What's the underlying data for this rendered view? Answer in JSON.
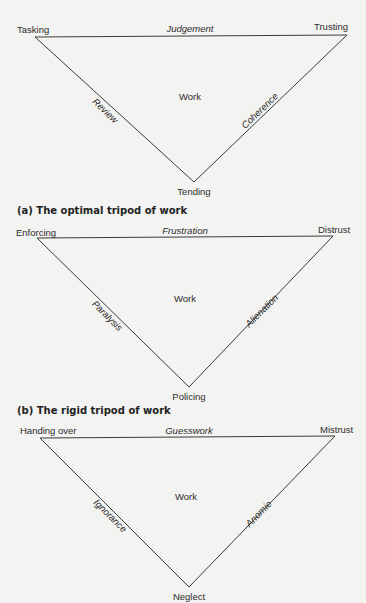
{
  "diagrams": [
    {
      "caption": "(a) The optimal tripod of work",
      "center": "Work",
      "vertices": {
        "top_left": "Tasking",
        "top_right": "Trusting",
        "bottom": "Tending"
      },
      "edges": {
        "top": "Judgement",
        "left": "Review",
        "right": "Coherence"
      }
    },
    {
      "caption": "(b) The rigid tripod of work",
      "center": "Work",
      "vertices": {
        "top_left": "Enforcing",
        "top_right": "Distrust",
        "bottom": "Policing"
      },
      "edges": {
        "top": "Frustration",
        "left": "Paralysis",
        "right": "Alienation"
      }
    },
    {
      "caption": "",
      "center": "Work",
      "vertices": {
        "top_left": "Handing over",
        "top_right": "Mistrust",
        "bottom": "Neglect"
      },
      "edges": {
        "top": "Guesswork",
        "left": "Ignorance",
        "right": "Anomie"
      }
    }
  ]
}
